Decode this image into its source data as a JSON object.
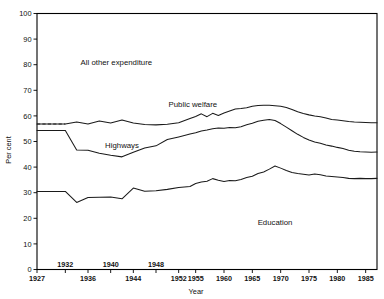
{
  "chart_data": {
    "type": "area",
    "title": "",
    "subtitle": "",
    "xlabel": "Year",
    "ylabel": "Per cent",
    "xlim": [
      1927,
      1987
    ],
    "ylim": [
      0,
      100
    ],
    "grid": false,
    "legend_position": "inline-annotations",
    "stacked": true,
    "note": "Cumulative percentage distribution of expenditure; plotted lines are cumulative upper boundaries of each band.",
    "y_ticks": [
      0,
      10,
      20,
      30,
      40,
      50,
      60,
      70,
      80,
      90,
      100
    ],
    "y_ticklabels": [
      "0",
      "10",
      "20",
      "30",
      "40",
      "50",
      "60",
      "70",
      "80",
      "90",
      "100"
    ],
    "x_ticks_upper_row": [
      1932,
      1940,
      1948
    ],
    "x_ticks_lower_row": [
      1927,
      1936,
      1944,
      1952,
      1955,
      1960,
      1965,
      1970,
      1975,
      1980,
      1985
    ],
    "x_ticklabels": [
      "1927",
      "1932",
      "1936",
      "1940",
      "1944",
      "1948",
      "1952",
      "1955",
      "1960",
      "1965",
      "1970",
      "1975",
      "1980",
      "1985"
    ],
    "band_labels": [
      {
        "name": "all-other-expenditure",
        "text": "All other expenditure",
        "x": 1941,
        "y": 80
      },
      {
        "name": "public-welfare",
        "text": "Public welfare",
        "x": 1954.5,
        "y": 63.5
      },
      {
        "name": "highways",
        "text": "Highways",
        "x": 1942,
        "y": 47.5
      },
      {
        "name": "education",
        "text": "Education",
        "x": 1969,
        "y": 17.5
      }
    ],
    "x": [
      1927,
      1932,
      1934,
      1936,
      1938,
      1940,
      1942,
      1944,
      1946,
      1948,
      1950,
      1952,
      1954,
      1955,
      1956,
      1957,
      1958,
      1959,
      1960,
      1961,
      1962,
      1963,
      1964,
      1965,
      1966,
      1967,
      1968,
      1969,
      1970,
      1971,
      1972,
      1973,
      1974,
      1975,
      1976,
      1977,
      1978,
      1979,
      1980,
      1981,
      1982,
      1983,
      1984,
      1985,
      1986,
      1987
    ],
    "series": [
      {
        "name": "Education",
        "cumulative_values": [
          30.5,
          30.5,
          26.2,
          28.1,
          28.2,
          28.3,
          27.6,
          31.8,
          30.6,
          30.8,
          31.3,
          32.0,
          32.4,
          33.6,
          34.2,
          34.5,
          35.5,
          34.9,
          34.4,
          34.8,
          34.7,
          35.2,
          35.9,
          36.4,
          37.5,
          38.1,
          39.2,
          40.4,
          39.6,
          38.7,
          37.9,
          37.5,
          37.2,
          36.9,
          37.3,
          37.0,
          36.5,
          36.3,
          36.1,
          35.9,
          35.6,
          35.5,
          35.6,
          35.5,
          35.5,
          35.6
        ]
      },
      {
        "name": "Highways",
        "cumulative_values": [
          54.3,
          54.3,
          46.7,
          46.6,
          45.4,
          44.6,
          44.0,
          45.8,
          47.5,
          48.3,
          50.8,
          51.8,
          52.9,
          53.4,
          54.1,
          54.5,
          55.0,
          55.3,
          55.2,
          55.5,
          55.4,
          55.8,
          56.5,
          57.1,
          57.9,
          58.3,
          58.6,
          58.2,
          57.0,
          55.6,
          54.2,
          52.8,
          51.6,
          50.6,
          49.8,
          49.3,
          48.6,
          48.2,
          47.7,
          47.3,
          46.6,
          46.2,
          46.0,
          45.9,
          45.8,
          45.9
        ]
      },
      {
        "name": "Public welfare",
        "cumulative_values": [
          56.8,
          56.8,
          57.6,
          56.8,
          58.0,
          57.2,
          58.4,
          57.2,
          56.6,
          56.5,
          56.7,
          57.3,
          59.0,
          59.8,
          60.8,
          59.7,
          61.0,
          60.2,
          61.1,
          61.9,
          62.7,
          62.9,
          63.2,
          63.8,
          64.1,
          64.2,
          64.2,
          64.0,
          63.8,
          63.3,
          62.5,
          61.6,
          60.9,
          60.4,
          60.0,
          59.7,
          59.2,
          58.6,
          58.4,
          58.1,
          57.8,
          57.6,
          57.5,
          57.4,
          57.3,
          57.3
        ]
      },
      {
        "name": "All other expenditure",
        "cumulative_values": [
          100,
          100,
          100,
          100,
          100,
          100,
          100,
          100,
          100,
          100,
          100,
          100,
          100,
          100,
          100,
          100,
          100,
          100,
          100,
          100,
          100,
          100,
          100,
          100,
          100,
          100,
          100,
          100,
          100,
          100,
          100,
          100,
          100,
          100,
          100,
          100,
          100,
          100,
          100,
          100,
          100,
          100,
          100,
          100,
          100,
          100
        ]
      }
    ],
    "dashed_leadin_segments": [
      {
        "series": "Education",
        "from_x": 1927,
        "to_x": 1932,
        "from_y": 30.5,
        "to_y": 30.5
      },
      {
        "series": "Highways",
        "from_x": 1927,
        "to_x": 1932,
        "from_y": 54.3,
        "to_y": 54.3
      },
      {
        "series": "Public welfare",
        "from_x": 1927,
        "to_x": 1932,
        "from_y": 56.8,
        "to_y": 56.8
      }
    ],
    "colors": {
      "line": "#1a1a1a",
      "axis": "#000000",
      "background": "#ffffff",
      "text": "#111111"
    }
  }
}
